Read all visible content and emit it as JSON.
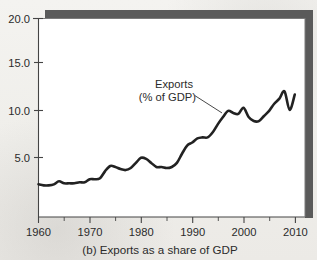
{
  "figure": {
    "caption": "(b) Exports as a share of GDP",
    "panel_label": "(b)",
    "background_color": "#f1f0ec",
    "ink_color": "#222222",
    "shadow_color": "#595959"
  },
  "annotation": {
    "line1": "Exports",
    "line2": "(% of GDP)"
  },
  "chart_data": {
    "type": "line",
    "title": "(b) Exports as a share of GDP",
    "xlabel": "",
    "ylabel": "",
    "xlim": [
      1960,
      2012
    ],
    "ylim": [
      0.5,
      20.0
    ],
    "grid": false,
    "legend": "annotation-label",
    "legend_position": "inside-upper-middle",
    "xticks": [
      1960,
      1970,
      1980,
      1990,
      2000,
      2010
    ],
    "xtick_labels": [
      "1960",
      "1970",
      "1980",
      "1990",
      "2000",
      "2010"
    ],
    "xminor_ticks": [
      1965,
      1975,
      1985,
      1995,
      2005
    ],
    "yticks": [
      5.0,
      10.0,
      15.0,
      20.0
    ],
    "ytick_labels": [
      "5.0",
      "10.0",
      "15.0",
      "20.0"
    ],
    "annotations": [
      {
        "text": "Exports\n(% of GDP)",
        "text_x": 1987.5,
        "text_y": 13.2,
        "leader_from_x": 1990.5,
        "leader_from_y": 12.4,
        "leader_to_x": 1995.8,
        "leader_to_y": 10.7
      }
    ],
    "series": [
      {
        "name": "Exports (% of GDP)",
        "color": "#222222",
        "line_width": 2.6,
        "x": [
          1960,
          1961,
          1962,
          1963,
          1964,
          1965,
          1966,
          1967,
          1968,
          1969,
          1970,
          1971,
          1972,
          1973,
          1974,
          1975,
          1976,
          1977,
          1978,
          1979,
          1980,
          1981,
          1982,
          1983,
          1984,
          1985,
          1986,
          1987,
          1988,
          1989,
          1990,
          1991,
          1992,
          1993,
          1994,
          1995,
          1996,
          1997,
          1998,
          1999,
          2000,
          2001,
          2002,
          2003,
          2004,
          2005,
          2006,
          2007,
          2008,
          2009,
          2010
        ],
        "values": [
          3.7,
          3.6,
          3.6,
          3.7,
          4.0,
          3.8,
          3.8,
          3.8,
          3.9,
          3.9,
          4.2,
          4.2,
          4.3,
          5.0,
          5.5,
          5.4,
          5.2,
          5.1,
          5.3,
          5.8,
          6.3,
          6.2,
          5.8,
          5.4,
          5.4,
          5.3,
          5.4,
          5.8,
          6.7,
          7.5,
          7.8,
          8.2,
          8.3,
          8.3,
          8.8,
          9.6,
          10.3,
          10.9,
          10.7,
          10.6,
          11.2,
          10.3,
          9.9,
          9.9,
          10.4,
          10.9,
          11.6,
          12.1,
          12.8,
          11.0,
          12.5
        ]
      }
    ]
  }
}
